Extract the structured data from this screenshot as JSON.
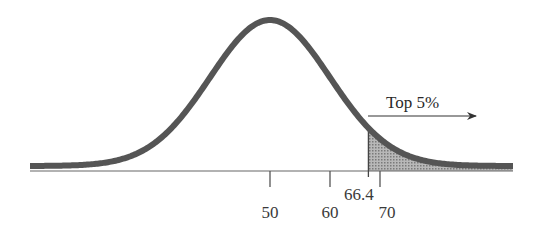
{
  "chart_data": {
    "type": "area",
    "title": "",
    "distribution": {
      "kind": "normal",
      "mean": 50,
      "sd": 10
    },
    "x_ticks": [
      50,
      60,
      66.4,
      70
    ],
    "tick_labels": [
      "50",
      "60",
      "66.4",
      "70"
    ],
    "shaded_region": {
      "from": 66.4,
      "to": "inf",
      "area_percent": 5
    },
    "annotations": [
      {
        "text": "Top 5%",
        "arrow": "right",
        "at_x": 66.4
      }
    ],
    "xlabel": "",
    "ylabel": "",
    "grid": false,
    "legend": null,
    "colors": {
      "curve": "#555555",
      "shade": "#9a9a9a",
      "axis": "#666666"
    }
  },
  "labels": {
    "tick_50": "50",
    "tick_60": "60",
    "tick_66_4": "66.4",
    "tick_70": "70",
    "top_annotation": "Top 5%"
  }
}
